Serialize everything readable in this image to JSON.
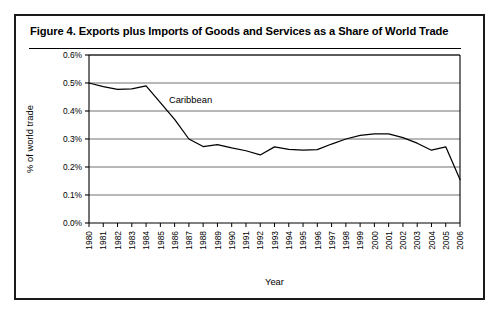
{
  "figure": {
    "title": "Figure 4.  Exports plus Imports of Goods and Services as a Share of World Trade",
    "frame_color": "#1a1a1a",
    "background": "#ffffff"
  },
  "chart_data": {
    "type": "line",
    "title": "Figure 4.  Exports plus Imports of Goods and Services as a Share of World Trade",
    "xlabel": "Year",
    "ylabel": "% of world trade",
    "xlim": [
      1980,
      2006
    ],
    "ylim": [
      0.0,
      0.6
    ],
    "grid": true,
    "grid_axis": "y",
    "legend": false,
    "line_color": "#000000",
    "x": [
      1980,
      1981,
      1982,
      1983,
      1984,
      1985,
      1986,
      1987,
      1988,
      1989,
      1990,
      1991,
      1992,
      1993,
      1994,
      1995,
      1996,
      1997,
      1998,
      1999,
      2000,
      2001,
      2002,
      2003,
      2004,
      2005,
      2006
    ],
    "series": [
      {
        "name": "Caribbean",
        "annotation": "Caribbean",
        "values": [
          0.5,
          0.487,
          0.477,
          0.479,
          0.49,
          0.43,
          0.37,
          0.3,
          0.273,
          0.28,
          0.268,
          0.258,
          0.243,
          0.272,
          0.263,
          0.26,
          0.262,
          0.282,
          0.3,
          0.313,
          0.318,
          0.318,
          0.305,
          0.285,
          0.26,
          0.272,
          0.155
        ]
      }
    ],
    "x_tick_labels": [
      "1980",
      "1981",
      "1982",
      "1983",
      "1984",
      "1985",
      "1986",
      "1987",
      "1988",
      "1989",
      "1990",
      "1991",
      "1992",
      "1993",
      "1994",
      "1995",
      "1996",
      "1997",
      "1998",
      "1999",
      "2000",
      "2001",
      "2002",
      "2003",
      "2004",
      "2005",
      "2006"
    ],
    "y_tick_values": [
      0.0,
      0.1,
      0.2,
      0.3,
      0.4,
      0.5,
      0.6
    ],
    "y_tick_labels": [
      "0.0%",
      "0.1%",
      "0.2%",
      "0.3%",
      "0.4%",
      "0.5%",
      "0.6%"
    ]
  }
}
